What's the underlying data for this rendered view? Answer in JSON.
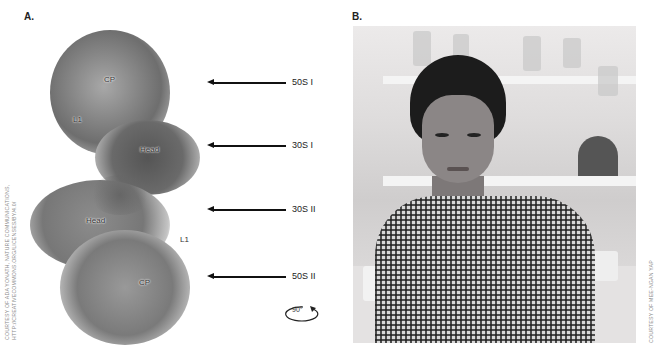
{
  "panel_a": {
    "label": "A.",
    "structure_labels": {
      "cp_top": "CP",
      "l1_top": "L1",
      "head_top": "Head",
      "head_bottom": "Head",
      "l1_bottom": "L1",
      "cp_bottom": "CP"
    },
    "arrows": [
      {
        "label": "50S I"
      },
      {
        "label": "30S I"
      },
      {
        "label": "30S II"
      },
      {
        "label": "50S II"
      }
    ],
    "rotation": "90°",
    "credit_line1": "COURTESY OF ADA YONATH, NATURE COMMUNICATIONS,",
    "credit_line2": "HTTP://CREATIVECOMMONS.ORG/LICENSES/BY/4.0/"
  },
  "panel_b": {
    "label": "B.",
    "credit": "COURTESY OF MEE-NGAN YAP"
  }
}
